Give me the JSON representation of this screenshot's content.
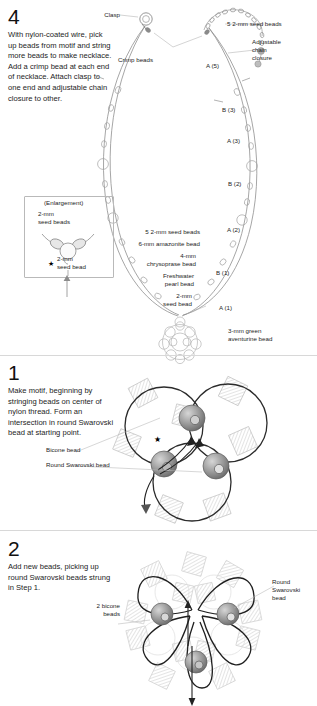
{
  "page": {
    "background": "#ffffff",
    "ink": "#1d1d1d",
    "bead_gray": "#9a9a9a",
    "bead_dark": "#6e6e6e",
    "line_gray": "#8c8c8c"
  },
  "step4": {
    "number": "4",
    "instructions": "With nylon-coated wire, pick up beads from motif and string more beads to make necklace. Add a crimp bead at each end of necklace. Attach clasp to one end and adjustable chain closure to other.",
    "labels": {
      "clasp": "Clasp",
      "crimp_beads": "Crimp beads",
      "seed_beads_top_right": "5 2-mm seed beads",
      "adjustable_chain_closure": "Adjustable\nchain\nclosure",
      "aventurine": "3-mm green\naventurine bead"
    },
    "segment_markers": [
      {
        "id": "A (5)",
        "label": "A (5)"
      },
      {
        "id": "B (3)",
        "label": "B (3)"
      },
      {
        "id": "A (3)",
        "label": "A (3)"
      },
      {
        "id": "B (2)",
        "label": "B (2)"
      },
      {
        "id": "A (2)",
        "label": "A (2)"
      },
      {
        "id": "B (1)",
        "label": "B (1)"
      },
      {
        "id": "A (1)",
        "label": "A (1)"
      }
    ],
    "center_callouts": [
      "5 2-mm seed beads",
      "6-mm amazonite bead",
      "4-mm",
      "chrysoprase bead",
      "Freshwater",
      "pearl bead",
      "2-mm",
      "seed bead"
    ],
    "enlargement": {
      "title": "(Enlargement)",
      "top_label": "2-mm\nseed beads",
      "bottom_label": "2-mm\nseed bead",
      "star": "★"
    }
  },
  "step1": {
    "number": "1",
    "instructions": "Make motif, beginning by stringing beads on center of nylon thread. Form an intersection in round Swarovski bead at starting point.",
    "labels": {
      "bicone": "Bicone bead",
      "round_swarovski": "Round Swarovski bead"
    },
    "star": "★"
  },
  "step2": {
    "number": "2",
    "instructions": "Add new beads, picking up round Swarovski beads strung in Step 1.",
    "labels": {
      "two_bicone": "2 bicone\nbeads",
      "round_swarovski": "Round\nSwarovski\nbead"
    }
  }
}
